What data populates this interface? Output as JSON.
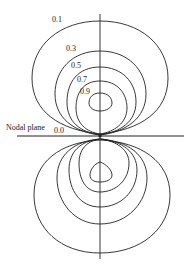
{
  "labels": {
    "nodal_plane": "Nodal plane",
    "nodal_value": "0.0",
    "contours": [
      "0.1",
      "0.3",
      "0.5",
      "0.7",
      "0.9"
    ]
  },
  "colors": {
    "line": "#222222",
    "background": "#ffffff"
  },
  "upper_lobe": {
    "contours": [
      {
        "value": "0.1",
        "top": 21,
        "left": 32,
        "right": 168,
        "bottom": 133
      },
      {
        "value": "0.3",
        "top": 51,
        "left": 55,
        "right": 146,
        "bottom": 134
      },
      {
        "value": "0.5",
        "top": 67,
        "left": 67,
        "right": 136,
        "bottom": 134
      },
      {
        "value": "0.7",
        "top": 81,
        "left": 76,
        "right": 127,
        "bottom": 134
      },
      {
        "value": "0.9",
        "top": 93,
        "left": 89,
        "right": 112,
        "bottom": 111
      }
    ]
  },
  "lower_lobe": {
    "contours": [
      {
        "value": "0.1",
        "top": 140,
        "left": 34,
        "right": 170,
        "bottom": 253
      },
      {
        "value": "0.3",
        "top": 139,
        "left": 57,
        "right": 147,
        "bottom": 224
      },
      {
        "value": "0.5",
        "top": 139,
        "left": 69,
        "right": 137,
        "bottom": 207
      },
      {
        "value": "0.7",
        "top": 139,
        "left": 79,
        "right": 129,
        "bottom": 192
      },
      {
        "value": "0.9",
        "top": 162,
        "left": 90,
        "right": 112,
        "bottom": 182
      }
    ]
  }
}
